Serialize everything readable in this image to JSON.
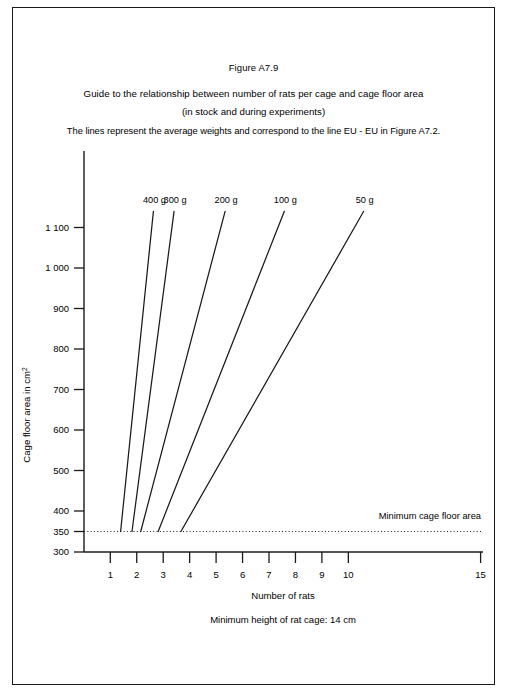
{
  "figure": {
    "title": "Figure A7.9",
    "subtitle_1": "Guide to the relationship between number of rats per cage and cage floor area",
    "subtitle_2": "(in stock and during experiments)",
    "subtitle_3": "The lines represent the average weights and correspond to the line EU - EU in Figure A7.2.",
    "footnote": "Minimum height of rat cage: 14 cm",
    "minimum_line_label": "Minimum cage floor area",
    "border_color": "#1a1a1a",
    "line_color": "#1a1a1a",
    "background": "#ffffff"
  },
  "chart_data": {
    "type": "line",
    "title": "Guide to the relationship between number of rats per cage and cage floor area",
    "xlabel": "Number of rats",
    "ylabel": "Cage floor area in cm2",
    "ylabel_base": "Cage floor area in cm",
    "ylabel_superscript": "2",
    "xlim": [
      0,
      15
    ],
    "ylim": [
      300,
      1150
    ],
    "grid": false,
    "legend": "inline-labels-at-line-tops",
    "x_ticks": [
      1,
      2,
      3,
      4,
      5,
      6,
      7,
      8,
      9,
      10,
      15
    ],
    "x_tick_labels": [
      "1",
      "2",
      "3",
      "4",
      "5",
      "6",
      "7",
      "8",
      "9",
      "10",
      "15"
    ],
    "y_ticks": [
      300,
      350,
      400,
      500,
      600,
      700,
      800,
      900,
      1000,
      1100
    ],
    "y_tick_labels": [
      "300",
      "350",
      "400",
      "500",
      "600",
      "700",
      "800",
      "900",
      "1 000",
      "1 100"
    ],
    "annotations": [
      {
        "text": "Minimum cage floor area",
        "y": 350,
        "x": 14.6
      }
    ],
    "reference_lines": [
      {
        "name": "minimum-cage-floor-area",
        "orientation": "horizontal",
        "value": 350,
        "style": "dotted"
      }
    ],
    "series": [
      {
        "name": "400 g",
        "label": "400 g",
        "points": [
          [
            1.39,
            350
          ],
          [
            2.63,
            1140
          ]
        ]
      },
      {
        "name": "300 g",
        "label": "300 g",
        "points": [
          [
            1.82,
            350
          ],
          [
            3.41,
            1140
          ]
        ]
      },
      {
        "name": "200 g",
        "label": "200 g",
        "points": [
          [
            2.15,
            350
          ],
          [
            5.34,
            1140
          ]
        ]
      },
      {
        "name": "100 g",
        "label": "100 g",
        "points": [
          [
            2.81,
            350
          ],
          [
            7.58,
            1140
          ]
        ]
      },
      {
        "name": "50 g",
        "label": "50 g",
        "points": [
          [
            3.67,
            350
          ],
          [
            10.58,
            1140
          ]
        ]
      }
    ]
  }
}
